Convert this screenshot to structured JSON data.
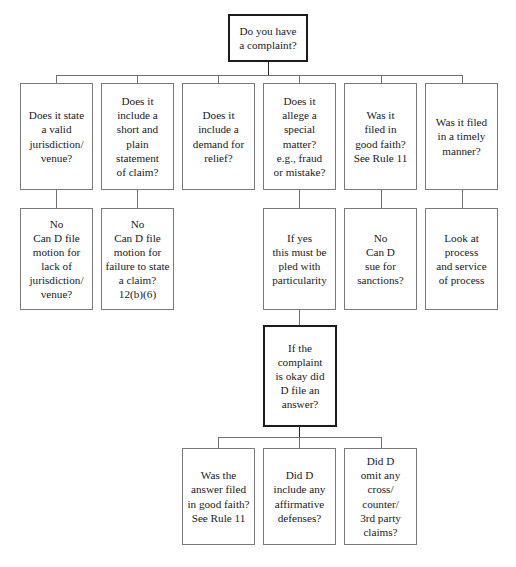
{
  "diagram": {
    "colors": {
      "box_border": "#7a7a7a",
      "emphasis_border": "#1c1c1c",
      "connector": "#6f6f6f",
      "background": "#ffffff",
      "text": "#1a1a1a"
    },
    "root": {
      "id": "root-complaint",
      "text": "Do you have\na complaint?",
      "emphasis": true
    },
    "row1": [
      {
        "id": "q-jurisdiction",
        "text": "Does it state\na valid\njurisdiction/\nvenue?"
      },
      {
        "id": "q-short-plain-statement",
        "text": "Does it\ninclude a\nshort and\nplain\nstatement\nof claim?"
      },
      {
        "id": "q-demand-relief",
        "text": "Does it\ninclude a\ndemand for\nrelief?"
      },
      {
        "id": "q-special-matter",
        "text": "Does it\nallege a\nspecial\nmatter?\ne.g., fraud\nor mistake?"
      },
      {
        "id": "q-good-faith",
        "text": "Was it\nfiled in\ngood faith?\nSee Rule 11"
      },
      {
        "id": "q-timely",
        "text": "Was it filed\nin a timely\nmanner?"
      }
    ],
    "row2": [
      {
        "id": "a-motion-jurisdiction",
        "text": "No\nCan D file\nmotion for\nlack of\njurisdiction/\nvenue?",
        "parent": "q-jurisdiction"
      },
      {
        "id": "a-motion-failure-state-claim",
        "text": "No\nCan D file\nmotion for\nfailure to state\na claim?\n12(b)(6)",
        "parent": "q-short-plain-statement"
      },
      {
        "id": "a-particularity",
        "text": "If yes\nthis must be\npled with\nparticularity",
        "parent": "q-special-matter"
      },
      {
        "id": "a-sanctions",
        "text": "No\nCan D\nsue for\nsanctions?",
        "parent": "q-good-faith"
      },
      {
        "id": "a-process-service",
        "text": "Look at\nprocess\nand service\nof process",
        "parent": "q-timely"
      }
    ],
    "middle": {
      "id": "q-did-d-answer",
      "text": "If the\ncomplaint\nis okay did\nD file an\nanswer?",
      "emphasis": true,
      "parent": "a-particularity"
    },
    "row3": [
      {
        "id": "q-answer-good-faith",
        "text": "Was the\nanswer filed\nin good faith?\nSee Rule 11",
        "parent": "q-did-d-answer"
      },
      {
        "id": "q-affirmative-defenses",
        "text": "Did D\ninclude any\naffirmative\ndefenses?",
        "parent": "q-did-d-answer"
      },
      {
        "id": "q-omitted-claims",
        "text": "Did D\nomit any\ncross/\ncounter/\n3rd party\nclaims?",
        "parent": "q-did-d-answer"
      }
    ]
  }
}
